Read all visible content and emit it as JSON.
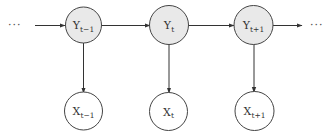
{
  "diagram": {
    "type": "hidden-markov-model",
    "colors": {
      "hidden_fill": "#e9e9e9",
      "observed_fill": "#ffffff",
      "stroke": "#444444",
      "edge": "#333333"
    },
    "ellipsis_left": "···",
    "ellipsis_right": "···",
    "hidden_nodes": [
      {
        "id": "Y_t-1",
        "base": "Y",
        "sub": "t−1",
        "cx": 83.5,
        "cy": 25
      },
      {
        "id": "Y_t",
        "base": "Y",
        "sub": "t",
        "cx": 169,
        "cy": 25
      },
      {
        "id": "Y_t+1",
        "base": "Y",
        "sub": "t+1",
        "cx": 253.5,
        "cy": 25
      }
    ],
    "observed_nodes": [
      {
        "id": "X_t-1",
        "base": "X",
        "sub": "t−1",
        "cx": 83.5,
        "cy": 111
      },
      {
        "id": "X_t",
        "base": "X",
        "sub": "t",
        "cx": 168.5,
        "cy": 111
      },
      {
        "id": "X_t+1",
        "base": "X",
        "sub": "t+1",
        "cx": 254.5,
        "cy": 111
      }
    ],
    "edges": [
      {
        "from": "ellipsis_left",
        "to": "Y_t-1"
      },
      {
        "from": "Y_t-1",
        "to": "Y_t"
      },
      {
        "from": "Y_t",
        "to": "Y_t+1"
      },
      {
        "from": "Y_t+1",
        "to": "ellipsis_right"
      },
      {
        "from": "Y_t-1",
        "to": "X_t-1"
      },
      {
        "from": "Y_t",
        "to": "X_t"
      },
      {
        "from": "Y_t+1",
        "to": "X_t+1"
      }
    ]
  }
}
